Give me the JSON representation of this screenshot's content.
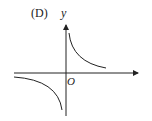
{
  "figure": {
    "option_label": "(D)",
    "y_axis_label": "y",
    "origin_label": "O",
    "curve_description": "hyperbola branches in quadrants I and III (y = k/x, k > 0)",
    "colors": {
      "line": "#222222",
      "background": "#ffffff"
    }
  }
}
